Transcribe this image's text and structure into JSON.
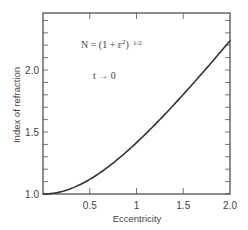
{
  "chart_data": {
    "type": "line",
    "title": "",
    "xlabel": "Eccentricity",
    "ylabel": "Index of refraction",
    "xlim": [
      0,
      2.0
    ],
    "ylim": [
      1.0,
      2.46
    ],
    "x_ticks": [
      {
        "value": 0.5,
        "label": "0.5"
      },
      {
        "value": 1.0,
        "label": "1"
      },
      {
        "value": 1.5,
        "label": "1.5"
      },
      {
        "value": 2.0,
        "label": "2.0"
      }
    ],
    "y_ticks": [
      {
        "value": 1.0,
        "label": "1.0"
      },
      {
        "value": 1.5,
        "label": "1.5"
      },
      {
        "value": 2.0,
        "label": "2.0"
      }
    ],
    "y_minor_step": 0.1,
    "grid": false,
    "legend": null,
    "annotations": [
      {
        "text": "N = (1 + ε²)^1/2",
        "x": 0.25,
        "y": 2.3
      },
      {
        "text": "t → 0",
        "x": 0.5,
        "y": 2.05
      }
    ],
    "series": [
      {
        "name": "N = (1 + e^2)^(1/2)",
        "x": [
          0,
          0.1,
          0.2,
          0.3,
          0.4,
          0.5,
          0.6,
          0.7,
          0.8,
          0.9,
          1.0,
          1.1,
          1.2,
          1.3,
          1.4,
          1.5,
          1.6,
          1.7,
          1.8,
          1.9,
          2.0
        ],
        "values": [
          1.0,
          1.005,
          1.02,
          1.044,
          1.077,
          1.118,
          1.166,
          1.221,
          1.281,
          1.345,
          1.414,
          1.487,
          1.562,
          1.64,
          1.72,
          1.803,
          1.887,
          1.972,
          2.059,
          2.147,
          2.236
        ]
      }
    ]
  },
  "labels": {
    "formula_main": "N = (1 + ε",
    "formula_exp": "2",
    "formula_close": ")",
    "formula_power": "1/2",
    "limit": "t → 0",
    "xlabel": "Eccentricity",
    "ylabel": "Index of refraction"
  }
}
